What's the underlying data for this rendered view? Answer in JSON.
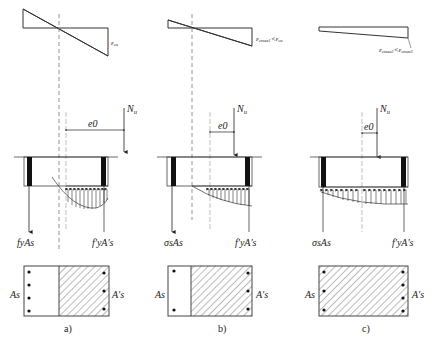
{
  "figure": {
    "panels": [
      {
        "id": "a",
        "caption": "a)",
        "strain_label": "εcu",
        "strain_label_main": "ε",
        "strain_label_sub": "cu",
        "eccentricity_label": "e0",
        "load_label": "Nu",
        "tension_steel_force": "fyAs",
        "compression_steel_force": "f'yA's",
        "tension_steel_area": "As",
        "compression_steel_area": "A's",
        "tension_bars": 4,
        "compression_bars": 3
      },
      {
        "id": "b",
        "caption": "b)",
        "strain_label": "εcmax1<εcu",
        "strain_label_main": "ε",
        "strain_label_sub": "cmax1",
        "strain_label_cmp": "<",
        "strain_label_main2": "ε",
        "strain_label_sub2": "cu",
        "eccentricity_label": "e0",
        "load_label": "Nu",
        "tension_steel_force": "σsAs",
        "compression_steel_force": "f'yA's",
        "tension_steel_area": "As",
        "compression_steel_area": "A's",
        "tension_bars": 2,
        "compression_bars": 3
      },
      {
        "id": "c",
        "caption": "c)",
        "strain_label": "εcmax2<εcmax1",
        "strain_label_main": "ε",
        "strain_label_sub": "cmax2",
        "strain_label_cmp": "<",
        "strain_label_main2": "ε",
        "strain_label_sub2": "cmax1",
        "eccentricity_label": "e0",
        "load_label": "Nu",
        "tension_steel_force": "σsAs",
        "compression_steel_force": "f'yA's",
        "tension_steel_area": "As",
        "compression_steel_area": "A's",
        "tension_bars": 3,
        "compression_bars": 4
      }
    ],
    "colors": {
      "line": "#333333",
      "hatch": "#555555",
      "dash": "#777777",
      "steel": "#111111",
      "background": "#ffffff"
    }
  }
}
